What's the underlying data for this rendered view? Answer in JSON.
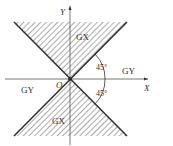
{
  "diagram": {
    "axes": {
      "x_label": "X",
      "y_label": "Y",
      "origin_label": "O"
    },
    "regions": {
      "top": "GX",
      "bottom": "GX",
      "right": "GY",
      "left": "GY"
    },
    "angles": {
      "upper": "45°",
      "lower": "45°"
    },
    "colors": {
      "line": "#333333",
      "hatch": "#555555",
      "background": "#ffffff"
    }
  }
}
